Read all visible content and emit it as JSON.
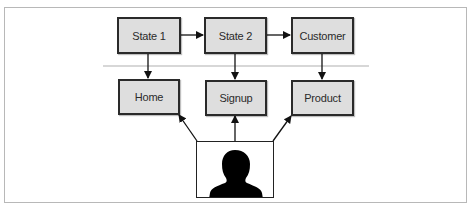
{
  "diagram": {
    "top_row": [
      {
        "id": "state1",
        "label": "State 1"
      },
      {
        "id": "state2",
        "label": "State 2"
      },
      {
        "id": "customer",
        "label": "Customer"
      }
    ],
    "bottom_row": [
      {
        "id": "home",
        "label": "Home"
      },
      {
        "id": "signup",
        "label": "Signup"
      },
      {
        "id": "product",
        "label": "Product"
      }
    ],
    "user": {
      "id": "user",
      "icon": "person-silhouette-icon"
    },
    "edges": [
      {
        "from": "state1",
        "to": "state2"
      },
      {
        "from": "state2",
        "to": "customer"
      },
      {
        "from": "state1",
        "to": "home"
      },
      {
        "from": "state2",
        "to": "signup"
      },
      {
        "from": "customer",
        "to": "product"
      },
      {
        "from": "user",
        "to": "home"
      },
      {
        "from": "user",
        "to": "signup"
      },
      {
        "from": "user",
        "to": "product"
      }
    ],
    "colors": {
      "node_fill": "#dedede",
      "node_border": "#2a2a2a",
      "separator": "#b0b0b0",
      "frame": "#b8b8b8"
    }
  }
}
